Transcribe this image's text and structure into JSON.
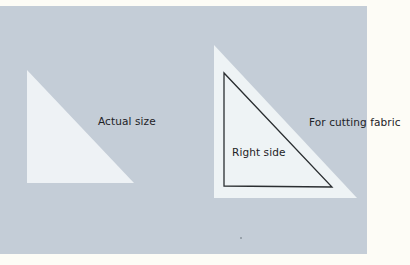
{
  "figure": {
    "labels": {
      "actual_size": "Actual size",
      "right_side": "Right side",
      "for_cutting_fabric": "For cutting fabric"
    },
    "colors": {
      "page_background": "#fdfcf6",
      "panel_background": "#c4cdd7",
      "template_fill": "#eef2f5",
      "outline": "#2a2e31",
      "text": "#1d2226"
    },
    "shapes": {
      "actual_size_triangle": "right triangle, right angle at bottom-left",
      "cutting_template_triangle": "larger right triangle with inner outlined right triangle (seam line)"
    }
  }
}
